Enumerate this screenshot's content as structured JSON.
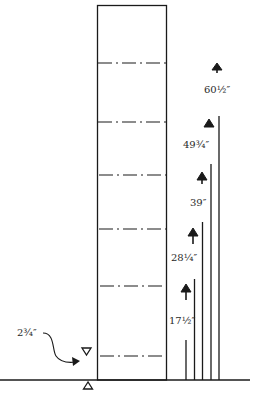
{
  "diagram": {
    "type": "elevation-with-measurements",
    "colors": {
      "line": "#1a1a1a",
      "background": "#ffffff",
      "text": "#2a2a2a"
    },
    "column": {
      "x": 97,
      "y": 5,
      "width": 69,
      "base_y": 380
    },
    "dashed_lines_y": [
      63,
      122,
      175,
      229,
      286,
      356
    ],
    "baseline": {
      "x1": 0,
      "x2": 250,
      "y": 380
    },
    "measurements": [
      {
        "label": "17½″",
        "line_x": 186,
        "line_top": 340,
        "arrow_x": 186,
        "arrow_y": 288,
        "text_x": 170,
        "text_y": 324
      },
      {
        "label": "28¼″",
        "line_x": 194,
        "line_top": 279,
        "arrow_x": 193,
        "arrow_y": 232,
        "text_x": 171,
        "text_y": 268
      },
      {
        "label": "39″",
        "line_x": 202,
        "line_top": 222,
        "arrow_x": 202,
        "arrow_y": 176,
        "text_x": 191,
        "text_y": 207
      },
      {
        "label": "49¾″",
        "line_x": 218,
        "line_top": 116,
        "arrow_x": 209,
        "arrow_y": 123,
        "text_x": 184,
        "text_y": 148
      },
      {
        "label": "60½″",
        "line_x": 211,
        "line_top": 164,
        "arrow_x": 217,
        "arrow_y": 67,
        "text_x": 204,
        "text_y": 92
      }
    ],
    "offset_annotation": {
      "label": "2¾″",
      "text_x": 18,
      "text_y": 335,
      "upper_marker": {
        "x": 86,
        "y": 351,
        "direction": "down"
      },
      "lower_marker": {
        "x": 88,
        "y": 384,
        "direction": "up"
      }
    }
  }
}
